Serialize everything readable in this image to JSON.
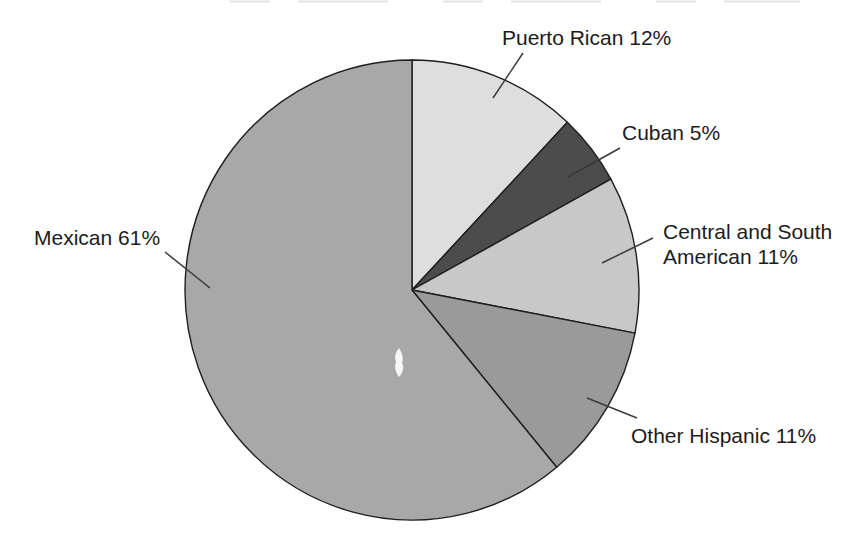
{
  "chart_data": {
    "type": "pie",
    "title": "",
    "direction": "clockwise",
    "start_position": "top",
    "legend": "none",
    "label_style": "external-callout-lines",
    "background_color": "#ffffff",
    "outline_color": "#1f1f1f",
    "segments": [
      {
        "label": "Puerto Rican",
        "value": 12,
        "display": "Puerto Rican 12%",
        "color": "#dedede"
      },
      {
        "label": "Cuban",
        "value": 5,
        "display": "Cuban 5%",
        "color": "#4c4c4c"
      },
      {
        "label": "Central and South American",
        "value": 11,
        "display": "Central and South American 11%",
        "color": "#c8c8c8"
      },
      {
        "label": "Other Hispanic",
        "value": 11,
        "display": "Other Hispanic 11%",
        "color": "#9a9a9a"
      },
      {
        "label": "Mexican",
        "value": 61,
        "display": "Mexican 61%",
        "color": "#a8a8a8"
      }
    ]
  }
}
